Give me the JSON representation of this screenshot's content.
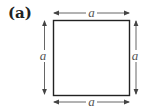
{
  "figure": {
    "panel_label": "(a)",
    "shape": "square",
    "dimensions": {
      "top": "a",
      "bottom": "a",
      "left": "a",
      "right": "a"
    },
    "colors": {
      "square_stroke": "#222222",
      "arrow_stroke": "#555555",
      "label_text": "#555555",
      "background": "#ffffff"
    }
  }
}
